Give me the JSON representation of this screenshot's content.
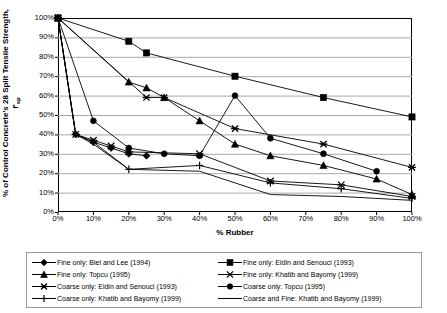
{
  "chart_data": {
    "type": "line",
    "title": "",
    "xlabel": "% Rubber",
    "ylabel": "% of Control Concrete's 28 Split Tensile Strength, f'sp",
    "ylabel_main": "% of Control Concrete's 28 Split Tensile Strength, f'",
    "ylabel_sub": "sp",
    "xlim": [
      0,
      100
    ],
    "ylim": [
      0,
      100
    ],
    "grid": "horizontal",
    "legend_position": "bottom",
    "xticks": [
      "0%",
      "10%",
      "20%",
      "30%",
      "40%",
      "50%",
      "60%",
      "70%",
      "80%",
      "90%",
      "100%"
    ],
    "yticks": [
      "0%",
      "10%",
      "20%",
      "30%",
      "40%",
      "50%",
      "60%",
      "70%",
      "80%",
      "90%",
      "100%"
    ],
    "series": [
      {
        "name": "Fine only: Biel and Lee (1994)",
        "marker": "diamond",
        "x": [
          0,
          5,
          10,
          15,
          20,
          25
        ],
        "values": [
          100,
          40,
          36,
          33,
          30,
          29
        ]
      },
      {
        "name": "Fine only: Eldin and Senouci (1993)",
        "marker": "square",
        "x": [
          0,
          20,
          25,
          50,
          75,
          100
        ],
        "values": [
          100,
          88,
          82,
          70,
          59,
          49
        ]
      },
      {
        "name": "Fine only: Topcu (1995)",
        "marker": "triangle",
        "x": [
          0,
          20,
          25,
          30,
          40,
          50,
          60,
          75,
          90,
          100
        ],
        "values": [
          100,
          67,
          64,
          59,
          47,
          35,
          29,
          24,
          17,
          9
        ]
      },
      {
        "name": "Fine only: Khatib and Bayomy (1999)",
        "marker": "x-bar",
        "x": [
          0,
          5,
          10,
          15,
          20,
          40,
          60,
          80,
          100
        ],
        "values": [
          100,
          40,
          37,
          34,
          31,
          30,
          16,
          14,
          8
        ]
      },
      {
        "name": "Coarse only: Eldin and Senouci (1993)",
        "marker": "asterisk",
        "x": [
          0,
          25,
          30,
          50,
          75,
          100
        ],
        "values": [
          100,
          59,
          59,
          43,
          35,
          23
        ]
      },
      {
        "name": "Coarse only: Topcu (1995)",
        "marker": "circle",
        "x": [
          0,
          10,
          20,
          30,
          40,
          50,
          60,
          75,
          90
        ],
        "values": [
          100,
          47,
          33,
          30,
          29,
          60,
          38,
          30,
          21
        ]
      },
      {
        "name": "Coarse only: Khatib and Bayomy (1999)",
        "marker": "plus-bar",
        "x": [
          0,
          5,
          10,
          20,
          40,
          60,
          80,
          100
        ],
        "values": [
          100,
          40,
          36,
          22,
          24,
          15,
          12,
          7
        ]
      },
      {
        "name": "Coarse and Fine: Khatib and Bayomy (1999)",
        "marker": "none",
        "x": [
          0,
          5,
          10,
          20,
          40,
          60,
          80,
          100
        ],
        "values": [
          100,
          40,
          35,
          22,
          21,
          9,
          8,
          6
        ]
      }
    ]
  },
  "legend": {
    "entries": [
      {
        "label": "Fine only: Biel and Lee (1994)",
        "marker": "diamond"
      },
      {
        "label": "Fine only: Eldin and Senouci (1993)",
        "marker": "square"
      },
      {
        "label": "Fine only: Topcu (1995)",
        "marker": "triangle"
      },
      {
        "label": "Fine only: Khatib and Bayomy (1999)",
        "marker": "x-bar"
      },
      {
        "label": "Coarse only: Eldin and Senouci (1993)",
        "marker": "asterisk"
      },
      {
        "label": "Coarse only: Topcu (1995)",
        "marker": "circle"
      },
      {
        "label": "Coarse only: Khatib and Bayomy (1999)",
        "marker": "plus-bar"
      },
      {
        "label": "Coarse and Fine: Khatib and Bayomy (1999)",
        "marker": "none"
      }
    ]
  },
  "colors": {
    "line": "#000000",
    "marker": "#000000",
    "grid": "#a8a8a8",
    "frame": "#000000",
    "legend_border": "#9a9a9a",
    "background": "#ffffff"
  }
}
